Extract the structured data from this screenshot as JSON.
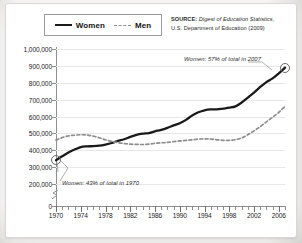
{
  "legend": {
    "items": [
      {
        "label": "Women",
        "style": "solid",
        "color": "#1a1a1a"
      },
      {
        "label": "Men",
        "style": "dashed",
        "color": "#8d8d8d"
      }
    ]
  },
  "source": {
    "key": "SOURCE:",
    "italic": " Digest of Education Statistics,",
    "rest": "U.S. Department of Education (2009)"
  },
  "annotations": [
    {
      "name": "women-2007-callout",
      "text": "Women: 57% of total in 2007"
    },
    {
      "name": "women-1970-callout",
      "text": "Women: 43% of total in 1970"
    }
  ],
  "chart_data": {
    "type": "line",
    "title": "",
    "subtitle": "",
    "xlabel": "",
    "ylabel": "",
    "xlim": [
      1970,
      2007
    ],
    "ylim": [
      0,
      1000000
    ],
    "y_axis_break": {
      "between": [
        0,
        200000
      ],
      "shown": true
    },
    "grid": true,
    "legend_position": "top-left",
    "ytick_labels": [
      "0",
      "200,000",
      "300,000",
      "400,000",
      "500,000",
      "600,000",
      "700,000",
      "800,000",
      "900,000",
      "1,000,000"
    ],
    "ytick_values": [
      0,
      200000,
      300000,
      400000,
      500000,
      600000,
      700000,
      800000,
      900000,
      1000000
    ],
    "xtick_labels": [
      "1970",
      "1974",
      "1978",
      "1982",
      "1986",
      "1990",
      "1994",
      "1998",
      "2002",
      "2006"
    ],
    "xtick_values": [
      1970,
      1974,
      1978,
      1982,
      1986,
      1990,
      1994,
      1998,
      2002,
      2006
    ],
    "x": [
      1970,
      1971,
      1972,
      1973,
      1974,
      1975,
      1976,
      1977,
      1978,
      1979,
      1980,
      1981,
      1982,
      1983,
      1984,
      1985,
      1986,
      1987,
      1988,
      1989,
      1990,
      1991,
      1992,
      1993,
      1994,
      1995,
      1996,
      1997,
      1998,
      1999,
      2000,
      2001,
      2002,
      2003,
      2004,
      2005,
      2006,
      2007
    ],
    "series": [
      {
        "name": "Women",
        "style": "solid",
        "color": "#1a1a1a",
        "endpoint_markers": [
          1970,
          2007
        ],
        "values": [
          341000,
          364000,
          386000,
          404000,
          419000,
          423000,
          424000,
          427000,
          434000,
          443000,
          455000,
          465000,
          479000,
          491000,
          498000,
          502000,
          512000,
          521000,
          533000,
          547000,
          560000,
          580000,
          606000,
          625000,
          637000,
          642000,
          642000,
          647000,
          652000,
          660000,
          683000,
          712000,
          742000,
          775000,
          804000,
          826000,
          855000,
          890000
        ]
      },
      {
        "name": "Men",
        "style": "dashed",
        "color": "#8d8d8d",
        "endpoint_markers": [],
        "values": [
          460000,
          475000,
          485000,
          489000,
          492000,
          490000,
          484000,
          474000,
          462000,
          452000,
          445000,
          440000,
          436000,
          435000,
          434000,
          436000,
          441000,
          444000,
          447000,
          451000,
          455000,
          458000,
          462000,
          466000,
          468000,
          466000,
          462000,
          459000,
          459000,
          463000,
          473000,
          492000,
          515000,
          540000,
          568000,
          596000,
          625000,
          660000
        ]
      }
    ],
    "notes": [
      "Women: 43% of total in 1970",
      "Women: 57% of total in 2007"
    ]
  }
}
